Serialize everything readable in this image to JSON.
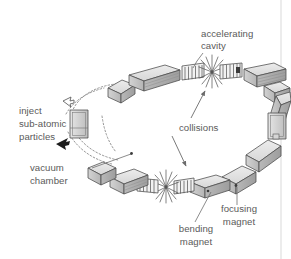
{
  "figure": {
    "background_color": "#ffffff",
    "text_color": "#5a5a5a",
    "line_color": "#4a4a4a"
  },
  "labels": {
    "accelerating_cavity_line1": "accelerating",
    "accelerating_cavity_line2": "cavity",
    "inject_line1": "inject",
    "inject_line2": "sub-atomic",
    "inject_line3": "particles",
    "vacuum_line1": "vacuum",
    "vacuum_line2": "chamber",
    "collisions": "collisions",
    "bending_line1": "bending",
    "bending_line2": "magnet",
    "focusing_line1": "focusing",
    "focusing_line2": "magnet"
  },
  "components": {
    "bending_magnets": 8,
    "focusing_magnets": 6,
    "accelerating_cavities": 4,
    "collision_points": 2,
    "vacuum_chamber_sections": 2,
    "injection_points": 1
  },
  "palette": {
    "box_top": "#e3e3e3",
    "box_front": "#c9c9c9",
    "box_side": "#a8a8a8",
    "outline": "#4a4a4a",
    "dotted_beam": "#8a8a8a",
    "border_rule": "#d9d9d9"
  }
}
